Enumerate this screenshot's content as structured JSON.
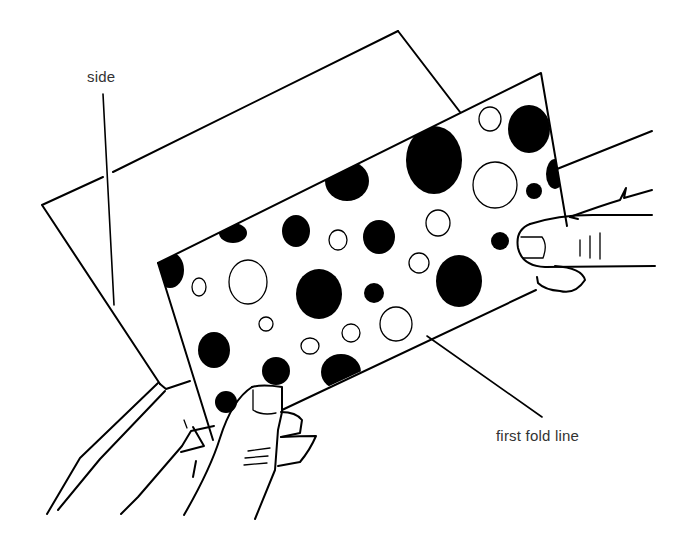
{
  "figure": {
    "labels": {
      "side": "side",
      "first_fold_line": "first fold line"
    },
    "colors": {
      "ink": "#000000",
      "background": "#ffffff",
      "label_text": "#333333"
    }
  }
}
